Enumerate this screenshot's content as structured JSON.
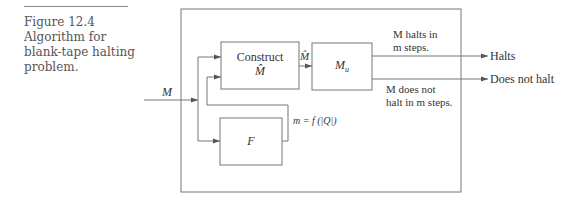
{
  "caption": {
    "figure_number": "Figure 12.4",
    "lines": [
      "Algorithm for",
      "blank-tape halting",
      "problem."
    ]
  },
  "diagram": {
    "input_label": "M",
    "boxes": {
      "construct": {
        "line1": "Construct",
        "line2": "M̂"
      },
      "mu": {
        "main": "M",
        "sub": "u"
      },
      "f": {
        "label": "F"
      }
    },
    "edge_labels": {
      "construct_to_mu": "M̂",
      "f_output": "m = f (|Q|)",
      "halts_condition_1": "M halts in",
      "halts_condition_2": "m steps.",
      "not_halts_condition_1": "M does not",
      "not_halts_condition_2": "halt in m steps."
    },
    "outputs": {
      "halts": "Halts",
      "does_not_halt": "Does not halt"
    }
  }
}
